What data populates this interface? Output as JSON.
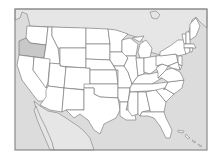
{
  "map": {
    "title": "",
    "region": "United States",
    "highlighted_state": "Oregon",
    "colors": {
      "background": "#ffffff",
      "water": "#dcdcdc",
      "foreign_land": "#e6e6e6",
      "state_fill": "#ffffff",
      "highlight_fill": "#c8c8c8",
      "border": "#6f6f6f",
      "frame": "#8a8a8a"
    },
    "states": [
      {
        "id": "WA",
        "name": "Washington"
      },
      {
        "id": "OR",
        "name": "Oregon",
        "highlighted": true
      },
      {
        "id": "CA",
        "name": "California"
      },
      {
        "id": "ID",
        "name": "Idaho"
      },
      {
        "id": "NV",
        "name": "Nevada"
      },
      {
        "id": "MT",
        "name": "Montana"
      },
      {
        "id": "WY",
        "name": "Wyoming"
      },
      {
        "id": "UT",
        "name": "Utah"
      },
      {
        "id": "AZ",
        "name": "Arizona"
      },
      {
        "id": "CO",
        "name": "Colorado"
      },
      {
        "id": "NM",
        "name": "New Mexico"
      },
      {
        "id": "ND",
        "name": "North Dakota"
      },
      {
        "id": "SD",
        "name": "South Dakota"
      },
      {
        "id": "NE",
        "name": "Nebraska"
      },
      {
        "id": "KS",
        "name": "Kansas"
      },
      {
        "id": "OK",
        "name": "Oklahoma"
      },
      {
        "id": "TX",
        "name": "Texas"
      },
      {
        "id": "MN",
        "name": "Minnesota"
      },
      {
        "id": "IA",
        "name": "Iowa"
      },
      {
        "id": "MO",
        "name": "Missouri"
      },
      {
        "id": "AR",
        "name": "Arkansas"
      },
      {
        "id": "LA",
        "name": "Louisiana"
      },
      {
        "id": "WI",
        "name": "Wisconsin"
      },
      {
        "id": "IL",
        "name": "Illinois"
      },
      {
        "id": "MI",
        "name": "Michigan"
      },
      {
        "id": "IN",
        "name": "Indiana"
      },
      {
        "id": "OH",
        "name": "Ohio"
      },
      {
        "id": "KY",
        "name": "Kentucky"
      },
      {
        "id": "TN",
        "name": "Tennessee"
      },
      {
        "id": "MS",
        "name": "Mississippi"
      },
      {
        "id": "AL",
        "name": "Alabama"
      },
      {
        "id": "GA",
        "name": "Georgia"
      },
      {
        "id": "FL",
        "name": "Florida"
      },
      {
        "id": "SC",
        "name": "South Carolina"
      },
      {
        "id": "NC",
        "name": "North Carolina"
      },
      {
        "id": "VA",
        "name": "Virginia"
      },
      {
        "id": "WV",
        "name": "West Virginia"
      },
      {
        "id": "PA",
        "name": "Pennsylvania"
      },
      {
        "id": "NY",
        "name": "New York"
      },
      {
        "id": "VT",
        "name": "Vermont"
      },
      {
        "id": "NH",
        "name": "New Hampshire"
      },
      {
        "id": "ME",
        "name": "Maine"
      },
      {
        "id": "MA",
        "name": "Massachusetts"
      },
      {
        "id": "CT",
        "name": "Connecticut"
      },
      {
        "id": "RI",
        "name": "Rhode Island"
      },
      {
        "id": "NJ",
        "name": "New Jersey"
      },
      {
        "id": "DE",
        "name": "Delaware"
      },
      {
        "id": "MD",
        "name": "Maryland"
      }
    ],
    "labels_visible": false
  }
}
